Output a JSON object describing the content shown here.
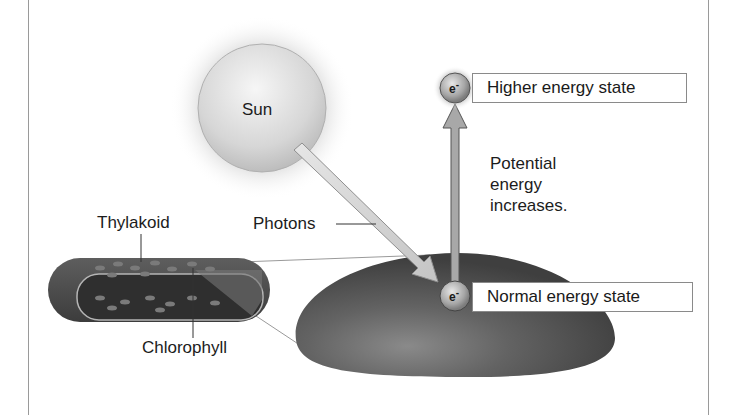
{
  "diagram": {
    "labels": {
      "sun": "Sun",
      "photons": "Photons",
      "thylakoid": "Thylakoid",
      "chlorophyll": "Chlorophyll",
      "potential_line1": "Potential",
      "potential_line2": "energy",
      "potential_line3": "increases."
    },
    "electron": {
      "symbol": "e",
      "charge": "-"
    },
    "states": {
      "higher": "Higher energy state",
      "normal": "Normal energy state"
    },
    "colors": {
      "membrane_dark": "#4a4a4a",
      "membrane_mid": "#6a6a6a",
      "sun_fill": "#dcdcdc",
      "arrow_fill": "#a8a8a8",
      "photon_fill": "#d8d8d8",
      "frame": "#9a9a9a"
    }
  }
}
